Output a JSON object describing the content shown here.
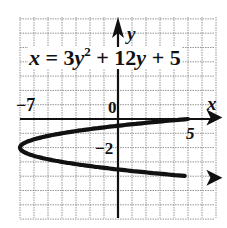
{
  "chart_data": {
    "type": "line",
    "title": "",
    "equation_label": {
      "lhs": "x",
      "eq": " = 3",
      "var1": "y",
      "sup": "2",
      "mid": " + 12",
      "var2": "y",
      "tail": " + 5"
    },
    "xlabel": "x",
    "ylabel": "y",
    "xlim": [
      -7,
      7
    ],
    "ylim": [
      -7,
      7
    ],
    "grid": true,
    "tick_labels": {
      "x_neg7": "−7",
      "origin": "0",
      "x_5": "5",
      "y_neg2": "−2"
    },
    "series": [
      {
        "name": "x = 3y^2 + 12y + 5",
        "vertex": [
          -7,
          -2
        ],
        "points": [
          {
            "x": 7,
            "y": 0.0
          },
          {
            "x": 5,
            "y": 0
          },
          {
            "x": 2,
            "y": -0.33
          },
          {
            "x": 0,
            "y": -0.47
          },
          {
            "x": -4,
            "y": -1.0
          },
          {
            "x": -7,
            "y": -2
          },
          {
            "x": -4,
            "y": -3.0
          },
          {
            "x": 0,
            "y": -3.53
          },
          {
            "x": 2,
            "y": -3.67
          },
          {
            "x": 5,
            "y": -4
          },
          {
            "x": 7,
            "y": -4.0
          }
        ]
      }
    ]
  },
  "colors": {
    "curve": "#111111",
    "axis": "#111111",
    "grid": "#8a8a8a",
    "background": "#ffffff"
  }
}
